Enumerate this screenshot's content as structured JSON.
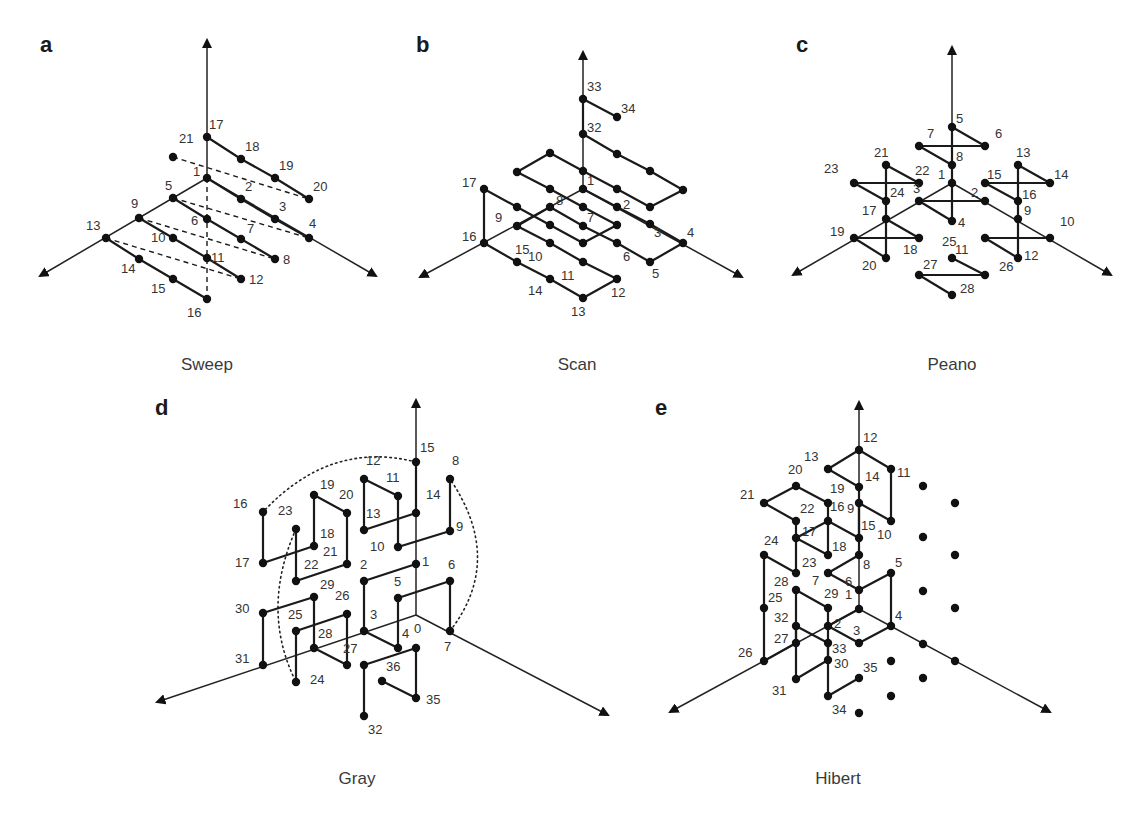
{
  "figure": {
    "panels": [
      {
        "id": "a",
        "letter": "a",
        "title": "Sweep",
        "labels": [
          "1",
          "2",
          "3",
          "4",
          "5",
          "6",
          "7",
          "8",
          "9",
          "10",
          "11",
          "12",
          "13",
          "14",
          "15",
          "16",
          "17",
          "18",
          "19",
          "20",
          "21"
        ],
        "edges": [
          [
            "17",
            "18"
          ],
          [
            "18",
            "19"
          ],
          [
            "19",
            "20"
          ],
          [
            "1",
            "2"
          ],
          [
            "2",
            "3"
          ],
          [
            "3",
            "4"
          ],
          [
            "5",
            "6"
          ],
          [
            "6",
            "7"
          ],
          [
            "7",
            "8"
          ],
          [
            "9",
            "10"
          ],
          [
            "10",
            "11"
          ],
          [
            "11",
            "12"
          ],
          [
            "13",
            "14"
          ],
          [
            "14",
            "15"
          ],
          [
            "15",
            "16"
          ]
        ],
        "dashed_edges": [
          [
            "21",
            "20"
          ],
          [
            "5",
            "4"
          ],
          [
            "9",
            "8"
          ],
          [
            "13",
            "12"
          ]
        ],
        "dotted_edges": [],
        "unlabeled_points": 0
      },
      {
        "id": "b",
        "letter": "b",
        "title": "Scan",
        "labels": [
          "1",
          "2",
          "3",
          "4",
          "5",
          "6",
          "7",
          "8",
          "9",
          "10",
          "11",
          "12",
          "13",
          "14",
          "15",
          "16",
          "17",
          "32",
          "33",
          "34"
        ],
        "edges": [
          [
            "1",
            "2"
          ],
          [
            "2",
            "3"
          ],
          [
            "3",
            "4"
          ],
          [
            "4",
            "5"
          ],
          [
            "5",
            "6"
          ],
          [
            "6",
            "7"
          ],
          [
            "7",
            "8"
          ],
          [
            "8",
            "9"
          ],
          [
            "9",
            "10"
          ],
          [
            "10",
            "11"
          ],
          [
            "11",
            "12"
          ],
          [
            "12",
            "13"
          ],
          [
            "13",
            "14"
          ],
          [
            "14",
            "15"
          ],
          [
            "15",
            "16"
          ],
          [
            "16",
            "17"
          ],
          [
            "17",
            "18"
          ],
          [
            "18",
            "19"
          ],
          [
            "19",
            "20"
          ],
          [
            "20",
            "21"
          ],
          [
            "21",
            "22"
          ],
          [
            "22",
            "23"
          ],
          [
            "23",
            "24"
          ],
          [
            "24",
            "25"
          ],
          [
            "25",
            "26"
          ],
          [
            "26",
            "27"
          ],
          [
            "27",
            "28"
          ],
          [
            "28",
            "29"
          ],
          [
            "29",
            "30"
          ],
          [
            "30",
            "31"
          ],
          [
            "31",
            "32"
          ],
          [
            "32",
            "33"
          ],
          [
            "33",
            "34"
          ]
        ],
        "dashed_edges": [],
        "dotted_edges": [],
        "unlabeled_points": 0
      },
      {
        "id": "c",
        "letter": "c",
        "title": "Peano",
        "labels": [
          "1",
          "2",
          "3",
          "4",
          "5",
          "6",
          "7",
          "8",
          "9",
          "10",
          "11",
          "12",
          "13",
          "14",
          "15",
          "16",
          "17",
          "18",
          "19",
          "20",
          "21",
          "22",
          "23",
          "24",
          "25",
          "26",
          "27",
          "28"
        ],
        "edges": [
          [
            "2",
            "3"
          ],
          [
            "3",
            "4"
          ],
          [
            "4",
            "5"
          ],
          [
            "5",
            "6"
          ],
          [
            "6",
            "7"
          ],
          [
            "7",
            "8"
          ],
          [
            "10",
            "11"
          ],
          [
            "11",
            "12"
          ],
          [
            "12",
            "13"
          ],
          [
            "13",
            "14"
          ],
          [
            "14",
            "15"
          ],
          [
            "15",
            "16"
          ],
          [
            "17",
            "18"
          ],
          [
            "18",
            "19"
          ],
          [
            "19",
            "20"
          ],
          [
            "20",
            "21"
          ],
          [
            "21",
            "22"
          ],
          [
            "22",
            "23"
          ],
          [
            "23",
            "24"
          ],
          [
            "25",
            "26"
          ],
          [
            "26",
            "27"
          ],
          [
            "27",
            "28"
          ]
        ],
        "dashed_edges": [],
        "dotted_edges": [],
        "unlabeled_points": 0
      },
      {
        "id": "d",
        "letter": "d",
        "title": "Gray",
        "labels": [
          "0",
          "1",
          "2",
          "3",
          "4",
          "5",
          "6",
          "7",
          "8",
          "9",
          "10",
          "11",
          "12",
          "13",
          "14",
          "15",
          "16",
          "17",
          "18",
          "19",
          "20",
          "21",
          "22",
          "23",
          "24",
          "25",
          "26",
          "27",
          "28",
          "29",
          "30",
          "31",
          "32",
          "35",
          "36"
        ],
        "edges": [
          [
            "1",
            "2"
          ],
          [
            "2",
            "3"
          ],
          [
            "3",
            "4"
          ],
          [
            "4",
            "5"
          ],
          [
            "5",
            "6"
          ],
          [
            "6",
            "7"
          ],
          [
            "8",
            "9"
          ],
          [
            "9",
            "10"
          ],
          [
            "10",
            "11"
          ],
          [
            "11",
            "12"
          ],
          [
            "12",
            "13"
          ],
          [
            "13",
            "14"
          ],
          [
            "14",
            "15"
          ],
          [
            "16",
            "17"
          ],
          [
            "17",
            "18"
          ],
          [
            "18",
            "19"
          ],
          [
            "19",
            "20"
          ],
          [
            "20",
            "21"
          ],
          [
            "21",
            "22"
          ],
          [
            "22",
            "23"
          ],
          [
            "24",
            "25"
          ],
          [
            "25",
            "26"
          ],
          [
            "26",
            "27"
          ],
          [
            "27",
            "28"
          ],
          [
            "28",
            "29"
          ],
          [
            "29",
            "30"
          ],
          [
            "30",
            "31"
          ],
          [
            "32",
            "33"
          ],
          [
            "33",
            "34"
          ],
          [
            "34",
            "35"
          ],
          [
            "35",
            "36"
          ]
        ],
        "dashed_edges": [],
        "dotted_edges": [
          [
            "15",
            "16"
          ],
          [
            "7",
            "8"
          ],
          [
            "23",
            "24"
          ]
        ],
        "unlabeled_points": 0
      },
      {
        "id": "e",
        "letter": "e",
        "title": "Hibert",
        "labels": [
          "1",
          "2",
          "3",
          "4",
          "5",
          "6",
          "7",
          "8",
          "9",
          "10",
          "11",
          "12",
          "13",
          "14",
          "15",
          "16",
          "17",
          "18",
          "19",
          "20",
          "21",
          "22",
          "23",
          "24",
          "25",
          "26",
          "27",
          "28",
          "29",
          "30",
          "31",
          "32",
          "33",
          "34",
          "35"
        ],
        "edges": [
          [
            "1",
            "2"
          ],
          [
            "2",
            "3"
          ],
          [
            "3",
            "4"
          ],
          [
            "4",
            "5"
          ],
          [
            "5",
            "6"
          ],
          [
            "6",
            "7"
          ],
          [
            "7",
            "8"
          ],
          [
            "8",
            "9"
          ],
          [
            "9",
            "10"
          ],
          [
            "10",
            "11"
          ],
          [
            "11",
            "12"
          ],
          [
            "12",
            "13"
          ],
          [
            "13",
            "14"
          ],
          [
            "14",
            "15"
          ],
          [
            "15",
            "16"
          ],
          [
            "16",
            "17"
          ],
          [
            "17",
            "18"
          ],
          [
            "18",
            "19"
          ],
          [
            "19",
            "20"
          ],
          [
            "20",
            "21"
          ],
          [
            "21",
            "22"
          ],
          [
            "22",
            "23"
          ],
          [
            "23",
            "24"
          ],
          [
            "24",
            "25"
          ],
          [
            "25",
            "26"
          ],
          [
            "26",
            "27"
          ],
          [
            "27",
            "28"
          ],
          [
            "28",
            "29"
          ],
          [
            "29",
            "30"
          ],
          [
            "30",
            "31"
          ],
          [
            "31",
            "32"
          ],
          [
            "32",
            "33"
          ],
          [
            "33",
            "34"
          ],
          [
            "34",
            "35"
          ]
        ],
        "dashed_edges": [],
        "dotted_edges": [],
        "unlabeled_points": 12
      }
    ]
  }
}
